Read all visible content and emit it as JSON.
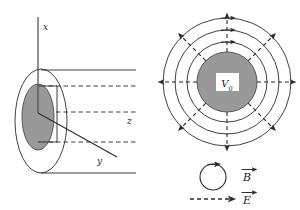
{
  "figure": {
    "colors": {
      "stroke": "#2b2b2b",
      "conductor_fill": "#999999",
      "label_box_fill": "#ffffff",
      "background": "#ffffff"
    }
  },
  "left_panel": {
    "name": "coaxial-cable-perspective",
    "axes": [
      {
        "id": "x",
        "label": "x",
        "orientation": "vertical-up"
      },
      {
        "id": "y",
        "label": "y",
        "orientation": "diagonal-down-right"
      },
      {
        "id": "z",
        "label": "z",
        "orientation": "horizontal-right"
      }
    ],
    "parts": {
      "outer_cylinder_label": "outer conductor",
      "inner_conductor_label": "inner conductor"
    }
  },
  "right_panel": {
    "name": "coaxial-cable-cross-section",
    "center_label": "V",
    "center_label_sub": "0",
    "field_lines": {
      "magnetic_circles": 3,
      "electric_rays": 8
    }
  },
  "legend": {
    "items": [
      {
        "id": "b-field",
        "symbol": "circle-arrow",
        "label": "B",
        "style": "solid"
      },
      {
        "id": "e-field",
        "symbol": "dashed-arrow",
        "label": "E",
        "style": "dashed"
      }
    ]
  }
}
